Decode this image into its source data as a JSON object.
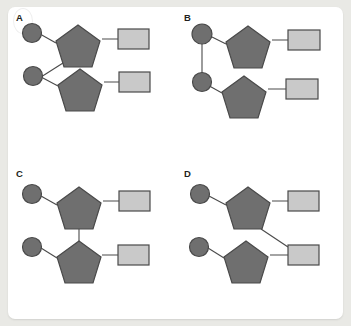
{
  "figure": {
    "background_color": "#e9e9e5",
    "card_color": "#ffffff",
    "colors": {
      "circle_fill": "#6f6f6f",
      "circle_stroke": "#4a4a4a",
      "pentagon_fill": "#6f6f6f",
      "pentagon_stroke": "#4a4a4a",
      "rectangle_fill": "#c9c9c9",
      "rectangle_stroke": "#4a4a4a",
      "link_stroke": "#4a4a4a",
      "label_color": "#231f20"
    },
    "panels": [
      {
        "id": "A",
        "label": "A",
        "position": "top-left",
        "nodes": [
          {
            "name": "circle-top",
            "shape": "circle",
            "fill": "#6f6f6f"
          },
          {
            "name": "pentagon-top",
            "shape": "pentagon",
            "fill": "#6f6f6f"
          },
          {
            "name": "rectangle-top",
            "shape": "rectangle",
            "fill": "#c9c9c9"
          },
          {
            "name": "circle-bottom",
            "shape": "circle",
            "fill": "#6f6f6f"
          },
          {
            "name": "pentagon-bottom",
            "shape": "pentagon",
            "fill": "#6f6f6f"
          },
          {
            "name": "rectangle-bottom",
            "shape": "rectangle",
            "fill": "#c9c9c9"
          }
        ],
        "links": [
          {
            "from": "circle-top",
            "to": "pentagon-top",
            "style": "diagonal"
          },
          {
            "from": "pentagon-top",
            "to": "rectangle-top",
            "style": "horizontal"
          },
          {
            "from": "pentagon-top",
            "to": "circle-bottom",
            "style": "diagonal"
          },
          {
            "from": "circle-bottom",
            "to": "pentagon-bottom",
            "style": "diagonal"
          },
          {
            "from": "pentagon-bottom",
            "to": "rectangle-bottom",
            "style": "horizontal"
          }
        ]
      },
      {
        "id": "B",
        "label": "B",
        "position": "top-right",
        "nodes": [
          {
            "name": "circle-top",
            "shape": "circle",
            "fill": "#6f6f6f"
          },
          {
            "name": "pentagon-top",
            "shape": "pentagon",
            "fill": "#6f6f6f"
          },
          {
            "name": "rectangle-top",
            "shape": "rectangle",
            "fill": "#c9c9c9"
          },
          {
            "name": "circle-bottom",
            "shape": "circle",
            "fill": "#6f6f6f"
          },
          {
            "name": "pentagon-bottom",
            "shape": "pentagon",
            "fill": "#6f6f6f"
          },
          {
            "name": "rectangle-bottom",
            "shape": "rectangle",
            "fill": "#c9c9c9"
          }
        ],
        "links": [
          {
            "from": "circle-top",
            "to": "pentagon-top",
            "style": "diagonal"
          },
          {
            "from": "pentagon-top",
            "to": "rectangle-top",
            "style": "horizontal"
          },
          {
            "from": "circle-top",
            "to": "circle-bottom",
            "style": "vertical"
          },
          {
            "from": "circle-bottom",
            "to": "pentagon-bottom",
            "style": "diagonal"
          },
          {
            "from": "pentagon-bottom",
            "to": "rectangle-bottom",
            "style": "horizontal"
          }
        ]
      },
      {
        "id": "C",
        "label": "C",
        "position": "bottom-left",
        "nodes": [
          {
            "name": "circle-top",
            "shape": "circle",
            "fill": "#6f6f6f"
          },
          {
            "name": "pentagon-top",
            "shape": "pentagon",
            "fill": "#6f6f6f"
          },
          {
            "name": "rectangle-top",
            "shape": "rectangle",
            "fill": "#c9c9c9"
          },
          {
            "name": "circle-bottom",
            "shape": "circle",
            "fill": "#6f6f6f"
          },
          {
            "name": "pentagon-bottom",
            "shape": "pentagon",
            "fill": "#6f6f6f"
          },
          {
            "name": "rectangle-bottom",
            "shape": "rectangle",
            "fill": "#c9c9c9"
          }
        ],
        "links": [
          {
            "from": "circle-top",
            "to": "pentagon-top",
            "style": "diagonal"
          },
          {
            "from": "pentagon-top",
            "to": "rectangle-top",
            "style": "horizontal"
          },
          {
            "from": "pentagon-top",
            "to": "pentagon-bottom",
            "style": "vertical"
          },
          {
            "from": "circle-bottom",
            "to": "pentagon-bottom",
            "style": "diagonal"
          },
          {
            "from": "pentagon-bottom",
            "to": "rectangle-bottom",
            "style": "horizontal"
          }
        ]
      },
      {
        "id": "D",
        "label": "D",
        "position": "bottom-right",
        "nodes": [
          {
            "name": "circle-top",
            "shape": "circle",
            "fill": "#6f6f6f"
          },
          {
            "name": "pentagon-top",
            "shape": "pentagon",
            "fill": "#6f6f6f"
          },
          {
            "name": "rectangle-top",
            "shape": "rectangle",
            "fill": "#c9c9c9"
          },
          {
            "name": "circle-bottom",
            "shape": "circle",
            "fill": "#6f6f6f"
          },
          {
            "name": "pentagon-bottom",
            "shape": "pentagon",
            "fill": "#6f6f6f"
          },
          {
            "name": "rectangle-bottom",
            "shape": "rectangle",
            "fill": "#c9c9c9"
          }
        ],
        "links": [
          {
            "from": "circle-top",
            "to": "pentagon-top",
            "style": "diagonal"
          },
          {
            "from": "pentagon-top",
            "to": "rectangle-top",
            "style": "horizontal"
          },
          {
            "from": "pentagon-top",
            "to": "rectangle-bottom",
            "style": "diagonal"
          },
          {
            "from": "circle-bottom",
            "to": "pentagon-bottom",
            "style": "diagonal"
          },
          {
            "from": "pentagon-bottom",
            "to": "rectangle-bottom",
            "style": "horizontal"
          }
        ]
      }
    ]
  }
}
